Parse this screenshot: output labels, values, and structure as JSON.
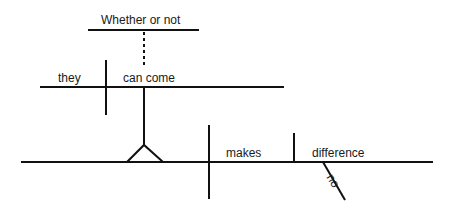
{
  "diagram": {
    "type": "sentence-diagram",
    "words": {
      "clause_connector": "Whether or not",
      "noun_clause_subject": "they",
      "noun_clause_verb": "can come",
      "main_verb": "makes",
      "direct_object": "difference",
      "modifier": "no"
    },
    "line_color": "#111111"
  }
}
